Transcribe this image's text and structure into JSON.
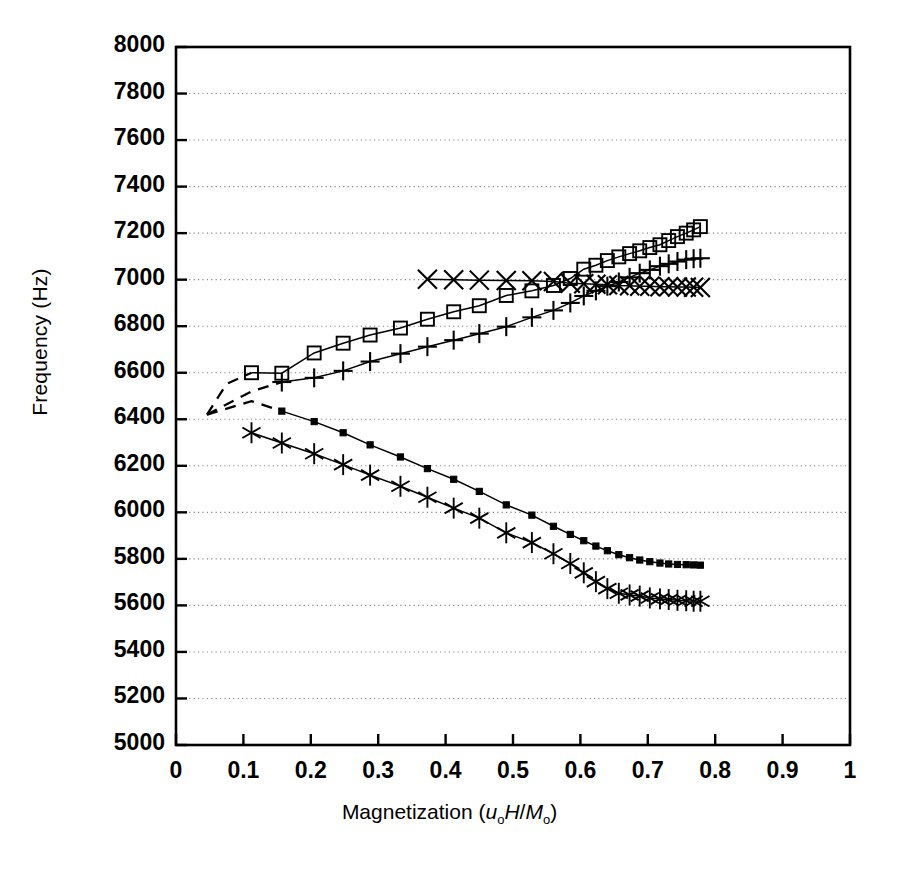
{
  "chart_data": {
    "type": "line",
    "title": "",
    "xlabel": "Magnetization (u₀H/M₀)",
    "ylabel": "Frequency (Hz)",
    "xlim": [
      0,
      1
    ],
    "ylim": [
      5000,
      8000
    ],
    "xticks": [
      "0",
      "0.1",
      "0.2",
      "0.3",
      "0.4",
      "0.5",
      "0.6",
      "0.7",
      "0.8",
      "0.9",
      "1"
    ],
    "xtick_values": [
      0,
      0.1,
      0.2,
      0.3,
      0.4,
      0.5,
      0.6,
      0.7,
      0.8,
      0.9,
      1
    ],
    "yticks": [
      "5000",
      "5200",
      "5400",
      "5600",
      "5800",
      "6000",
      "6200",
      "6400",
      "6600",
      "6800",
      "7000",
      "7200",
      "7400",
      "7600",
      "7800",
      "8000"
    ],
    "ytick_values": [
      5000,
      5200,
      5400,
      5600,
      5800,
      6000,
      6200,
      6400,
      6600,
      6800,
      7000,
      7200,
      7400,
      7600,
      7800,
      8000
    ],
    "grid": "horizontal-dotted",
    "legend": "none",
    "series": [
      {
        "name": "upper-branch-open-square",
        "marker": "open-square",
        "x": [
          0.112,
          0.157,
          0.205,
          0.248,
          0.288,
          0.333,
          0.373,
          0.412,
          0.45,
          0.49,
          0.528,
          0.56,
          0.585,
          0.605,
          0.623,
          0.64,
          0.657,
          0.673,
          0.688,
          0.703,
          0.718,
          0.731,
          0.744,
          0.757,
          0.768,
          0.778
        ],
        "y": [
          6600,
          6598,
          6685,
          6727,
          6762,
          6792,
          6830,
          6862,
          6888,
          6932,
          6952,
          6975,
          7005,
          7045,
          7062,
          7082,
          7098,
          7112,
          7124,
          7138,
          7150,
          7168,
          7185,
          7200,
          7214,
          7228
        ]
      },
      {
        "name": "upper-branch-plus",
        "marker": "plus",
        "x": [
          0.157,
          0.205,
          0.248,
          0.288,
          0.333,
          0.373,
          0.412,
          0.45,
          0.49,
          0.528,
          0.56,
          0.585,
          0.605,
          0.623,
          0.64,
          0.657,
          0.673,
          0.688,
          0.703,
          0.718,
          0.731,
          0.744,
          0.757,
          0.768,
          0.778
        ],
        "y": [
          6560,
          6578,
          6608,
          6648,
          6682,
          6712,
          6740,
          6768,
          6798,
          6838,
          6868,
          6900,
          6930,
          6952,
          6972,
          6990,
          7010,
          7028,
          7042,
          7058,
          7068,
          7078,
          7086,
          7090,
          7092
        ]
      },
      {
        "name": "flat-branch-cross",
        "marker": "cross",
        "x": [
          0.373,
          0.412,
          0.45,
          0.49,
          0.528,
          0.56,
          0.585,
          0.605,
          0.623,
          0.64,
          0.657,
          0.673,
          0.688,
          0.703,
          0.718,
          0.731,
          0.744,
          0.757,
          0.768,
          0.778
        ],
        "y": [
          7002,
          7000,
          6998,
          6996,
          6995,
          6992,
          6985,
          6982,
          6980,
          6978,
          6975,
          6974,
          6972,
          6972,
          6970,
          6970,
          6968,
          6968,
          6967,
          6966
        ]
      },
      {
        "name": "lower-branch-filled-square",
        "marker": "filled-square",
        "x": [
          0.157,
          0.205,
          0.248,
          0.288,
          0.333,
          0.373,
          0.412,
          0.45,
          0.49,
          0.528,
          0.56,
          0.585,
          0.605,
          0.623,
          0.64,
          0.657,
          0.673,
          0.688,
          0.703,
          0.718,
          0.731,
          0.744,
          0.757,
          0.768,
          0.778
        ],
        "y": [
          6435,
          6390,
          6342,
          6290,
          6238,
          6188,
          6142,
          6090,
          6032,
          5988,
          5940,
          5905,
          5878,
          5855,
          5835,
          5818,
          5805,
          5795,
          5788,
          5782,
          5778,
          5776,
          5775,
          5774,
          5773
        ]
      },
      {
        "name": "lower-branch-asterisk",
        "marker": "asterisk",
        "x": [
          0.112,
          0.157,
          0.205,
          0.248,
          0.288,
          0.333,
          0.373,
          0.412,
          0.45,
          0.49,
          0.528,
          0.56,
          0.585,
          0.605,
          0.623,
          0.64,
          0.657,
          0.673,
          0.688,
          0.703,
          0.718,
          0.731,
          0.744,
          0.757,
          0.768,
          0.778
        ],
        "y": [
          6342,
          6298,
          6252,
          6205,
          6160,
          6112,
          6065,
          6018,
          5975,
          5912,
          5870,
          5822,
          5780,
          5740,
          5702,
          5672,
          5652,
          5645,
          5640,
          5632,
          5628,
          5625,
          5622,
          5620,
          5618,
          5618
        ]
      }
    ],
    "dashed_branches": [
      {
        "name": "branch-to-upper-square",
        "x": [
          0.046,
          0.075,
          0.112
        ],
        "y": [
          6420,
          6552,
          6600
        ]
      },
      {
        "name": "branch-to-upper-plus",
        "x": [
          0.046,
          0.112,
          0.157
        ],
        "y": [
          6420,
          6520,
          6560
        ]
      },
      {
        "name": "branch-to-lower",
        "x": [
          0.046,
          0.112,
          0.157
        ],
        "y": [
          6420,
          6478,
          6435
        ]
      }
    ]
  },
  "axes": {
    "ylabel": "Frequency (Hz)",
    "xlabel_prefix": "Magnetization (",
    "xlabel_u": "u",
    "xlabel_u_sub": "o",
    "xlabel_H": "H",
    "xlabel_slash": "/",
    "xlabel_M": "M",
    "xlabel_M_sub": "o",
    "xlabel_suffix": ")"
  },
  "colors": {
    "axis": "#000000",
    "grid": "#888888",
    "series": "#000000",
    "background": "#ffffff"
  }
}
